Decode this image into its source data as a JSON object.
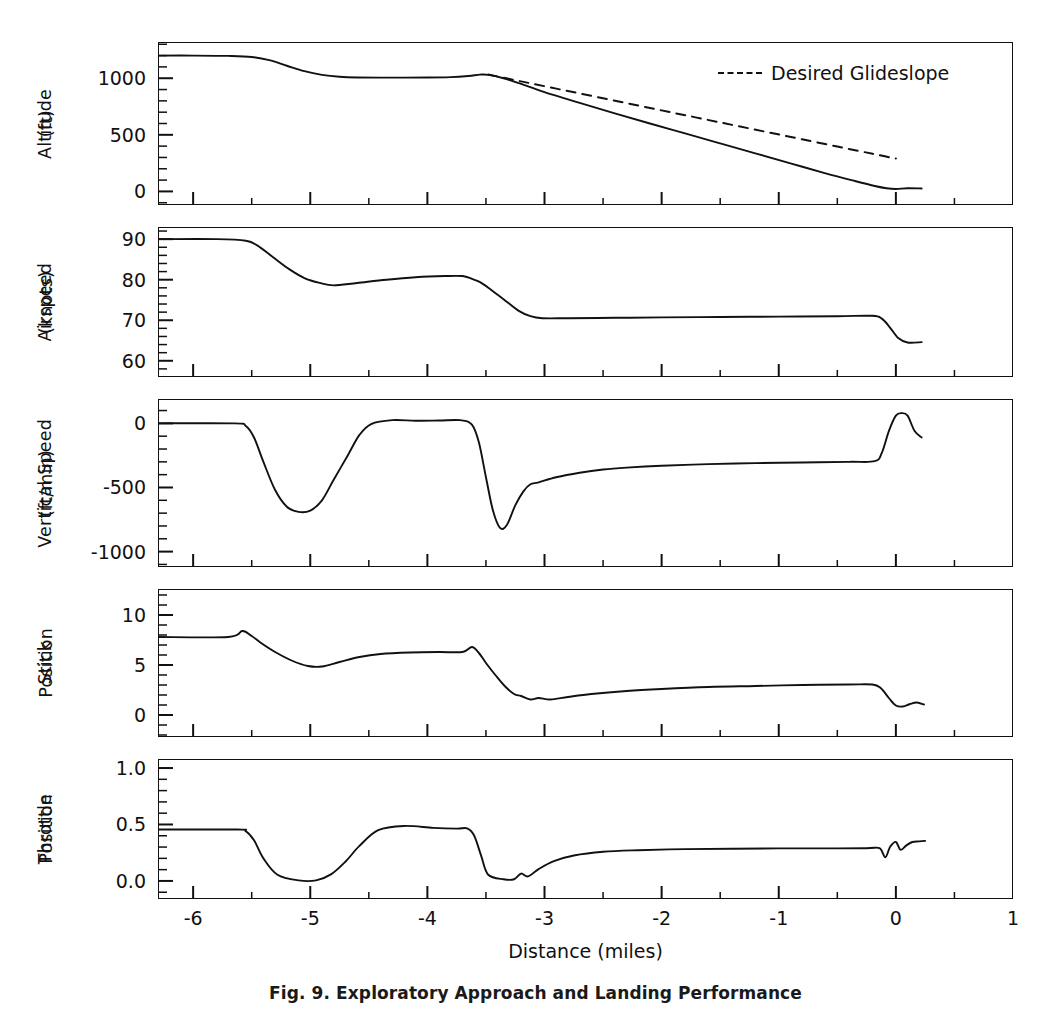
{
  "figure": {
    "caption": "Fig. 9.  Exploratory Approach and Landing Performance",
    "xaxis_title": "Distance (miles)",
    "xticks": [
      "-6",
      "-5",
      "-4",
      "-3",
      "-2",
      "-1",
      "0",
      "1"
    ],
    "legend": {
      "label": "Desired Glideslope",
      "style": "dashed",
      "color": "#111111"
    },
    "line_color": "#111111",
    "frame_color": "#111111",
    "background": "#ffffff"
  },
  "panels": [
    {
      "id": "altitude",
      "ylabel_line1": "Altitude",
      "ylabel_line2": "(ft)",
      "yticks": [
        "1000",
        "500",
        "0"
      ]
    },
    {
      "id": "airspeed",
      "ylabel_line1": "Airspeed",
      "ylabel_line2": "(knots)",
      "yticks": [
        "90",
        "80",
        "70",
        "60"
      ]
    },
    {
      "id": "vertical-speed",
      "ylabel_line1": "Vertical Speed",
      "ylabel_line2": "(ft/min)",
      "yticks": [
        "0",
        "-500",
        "-1000"
      ]
    },
    {
      "id": "stick-position",
      "ylabel_line1": "Stick",
      "ylabel_line2": "Position",
      "yticks": [
        "10",
        "5",
        "0"
      ]
    },
    {
      "id": "throttle-position",
      "ylabel_line1": "Throttle",
      "ylabel_line2": "Position",
      "yticks": [
        "1.0",
        "0.5",
        "0.0"
      ]
    }
  ],
  "chart_data": {
    "type": "line",
    "title": "Exploratory Approach and Landing Performance",
    "xlabel": "Distance (miles)",
    "xlim": [
      -6.3,
      1.0
    ],
    "xticks": [
      -6,
      -5,
      -4,
      -3,
      -2,
      -1,
      0,
      1
    ],
    "grid": false,
    "legend_position": "top-right (altitude panel)",
    "subplots": [
      {
        "id": "altitude",
        "ylabel": "Altitude (ft)",
        "ylim": [
          -120,
          1320
        ],
        "yticks": [
          0,
          500,
          1000
        ],
        "series": [
          {
            "name": "Actual Altitude",
            "style": "solid",
            "x": [
              -6.3,
              -6.0,
              -5.7,
              -5.5,
              -5.35,
              -5.2,
              -5.05,
              -4.9,
              -4.75,
              -4.6,
              -4.3,
              -4.0,
              -3.8,
              -3.65,
              -3.55,
              -3.48,
              -3.35,
              -3.2,
              -3.0,
              -2.7,
              -2.4,
              -2.1,
              -1.8,
              -1.5,
              -1.2,
              -0.9,
              -0.6,
              -0.35,
              -0.18,
              -0.08,
              0.0,
              0.1,
              0.22
            ],
            "y": [
              1200,
              1200,
              1197,
              1188,
              1160,
              1110,
              1062,
              1030,
              1013,
              1007,
              1005,
              1006,
              1010,
              1020,
              1032,
              1030,
              1000,
              950,
              878,
              782,
              690,
              600,
              512,
              424,
              336,
              248,
              160,
              92,
              48,
              28,
              22,
              28,
              26
            ]
          },
          {
            "name": "Desired Glideslope",
            "style": "dashed",
            "x": [
              -3.48,
              -3.2,
              -2.9,
              -2.6,
              -2.3,
              -2.0,
              -1.7,
              -1.4,
              -1.1,
              -0.8,
              -0.5,
              -0.3,
              -0.15,
              0.0
            ],
            "y": [
              1032,
              972,
              908,
              844,
              780,
              716,
              652,
              588,
              524,
              460,
              396,
              354,
              322,
              290
            ]
          }
        ]
      },
      {
        "id": "airspeed",
        "ylabel": "Airspeed (knots)",
        "ylim": [
          56,
          93
        ],
        "yticks": [
          60,
          70,
          80,
          90
        ],
        "series": [
          {
            "name": "Airspeed",
            "style": "solid",
            "x": [
              -6.3,
              -5.8,
              -5.55,
              -5.45,
              -5.32,
              -5.18,
              -5.05,
              -4.92,
              -4.8,
              -4.6,
              -4.35,
              -4.1,
              -3.85,
              -3.7,
              -3.62,
              -3.55,
              -3.46,
              -3.35,
              -3.22,
              -3.12,
              -3.02,
              -2.8,
              -2.4,
              -2.0,
              -1.5,
              -1.0,
              -0.5,
              -0.2,
              -0.12,
              -0.05,
              0.02,
              0.1,
              0.22
            ],
            "y": [
              90.0,
              90.0,
              89.6,
              88.4,
              85.6,
              82.6,
              80.4,
              79.2,
              78.6,
              79.2,
              80.0,
              80.6,
              80.9,
              80.9,
              80.2,
              79.4,
              77.6,
              75.2,
              72.3,
              71.0,
              70.5,
              70.5,
              70.6,
              70.7,
              70.8,
              70.9,
              71.0,
              71.1,
              70.4,
              68.2,
              65.6,
              64.5,
              64.6
            ]
          }
        ]
      },
      {
        "id": "vertical-speed",
        "ylabel": "Vertical Speed (ft/min)",
        "ylim": [
          -1120,
          190
        ],
        "yticks": [
          -1000,
          -500,
          0
        ],
        "series": [
          {
            "name": "Vertical Speed",
            "style": "solid",
            "x": [
              -6.3,
              -5.65,
              -5.55,
              -5.48,
              -5.4,
              -5.3,
              -5.2,
              -5.1,
              -5.0,
              -4.9,
              -4.8,
              -4.68,
              -4.58,
              -4.48,
              -4.3,
              -4.1,
              -3.9,
              -3.72,
              -3.62,
              -3.56,
              -3.5,
              -3.44,
              -3.38,
              -3.32,
              -3.25,
              -3.18,
              -3.12,
              -3.05,
              -2.9,
              -2.7,
              -2.5,
              -2.3,
              -2.0,
              -1.6,
              -1.2,
              -0.8,
              -0.4,
              -0.18,
              -0.12,
              -0.06,
              0.0,
              0.05,
              0.1,
              0.16,
              0.22
            ],
            "y": [
              0,
              0,
              -20,
              -110,
              -300,
              -520,
              -650,
              -690,
              -680,
              -600,
              -440,
              -250,
              -90,
              -5,
              25,
              20,
              22,
              25,
              -10,
              -150,
              -420,
              -680,
              -815,
              -790,
              -640,
              -530,
              -475,
              -460,
              -420,
              -385,
              -360,
              -345,
              -330,
              -318,
              -310,
              -305,
              -300,
              -295,
              -230,
              -60,
              60,
              80,
              60,
              -60,
              -110
            ]
          }
        ]
      },
      {
        "id": "stick-position",
        "ylabel": "Stick Position",
        "ylim": [
          -2.2,
          12.6
        ],
        "yticks": [
          0,
          5,
          10
        ],
        "series": [
          {
            "name": "Stick Position",
            "style": "solid",
            "x": [
              -6.3,
              -5.7,
              -5.58,
              -5.5,
              -5.42,
              -5.3,
              -5.15,
              -5.02,
              -4.9,
              -4.75,
              -4.58,
              -4.4,
              -4.15,
              -3.9,
              -3.7,
              -3.62,
              -3.56,
              -3.5,
              -3.42,
              -3.34,
              -3.26,
              -3.2,
              -3.12,
              -3.05,
              -2.95,
              -2.8,
              -2.6,
              -2.3,
              -2.0,
              -1.6,
              -1.2,
              -0.8,
              -0.4,
              -0.2,
              -0.13,
              -0.06,
              0.0,
              0.06,
              0.12,
              0.18,
              0.24
            ],
            "y": [
              7.8,
              7.8,
              8.4,
              7.9,
              7.2,
              6.3,
              5.4,
              4.9,
              4.85,
              5.3,
              5.8,
              6.1,
              6.25,
              6.3,
              6.3,
              6.8,
              6.2,
              5.2,
              4.0,
              2.9,
              2.1,
              1.9,
              1.55,
              1.7,
              1.55,
              1.8,
              2.1,
              2.4,
              2.6,
              2.8,
              2.9,
              3.0,
              3.05,
              3.05,
              2.7,
              1.7,
              0.95,
              0.85,
              1.1,
              1.25,
              1.05
            ]
          }
        ]
      },
      {
        "id": "throttle-position",
        "ylabel": "Throttle Position",
        "ylim": [
          -0.16,
          1.08
        ],
        "yticks": [
          0.0,
          0.5,
          1.0
        ],
        "series": [
          {
            "name": "Throttle Position",
            "style": "solid",
            "x": [
              -6.3,
              -5.62,
              -5.55,
              -5.48,
              -5.4,
              -5.28,
              -5.1,
              -4.95,
              -4.82,
              -4.7,
              -4.58,
              -4.42,
              -4.2,
              -3.95,
              -3.75,
              -3.66,
              -3.6,
              -3.54,
              -3.48,
              -3.35,
              -3.26,
              -3.2,
              -3.14,
              -3.05,
              -2.92,
              -2.75,
              -2.5,
              -2.2,
              -1.8,
              -1.4,
              -1.0,
              -0.6,
              -0.25,
              -0.14,
              -0.09,
              -0.05,
              0.0,
              0.04,
              0.09,
              0.14,
              0.2,
              0.25
            ],
            "y": [
              0.455,
              0.455,
              0.44,
              0.36,
              0.2,
              0.055,
              0.005,
              0.005,
              0.06,
              0.17,
              0.31,
              0.45,
              0.487,
              0.47,
              0.463,
              0.465,
              0.4,
              0.22,
              0.055,
              0.015,
              0.015,
              0.065,
              0.04,
              0.105,
              0.175,
              0.225,
              0.258,
              0.272,
              0.282,
              0.285,
              0.288,
              0.288,
              0.29,
              0.29,
              0.21,
              0.3,
              0.345,
              0.275,
              0.315,
              0.345,
              0.35,
              0.355
            ]
          }
        ]
      }
    ]
  }
}
